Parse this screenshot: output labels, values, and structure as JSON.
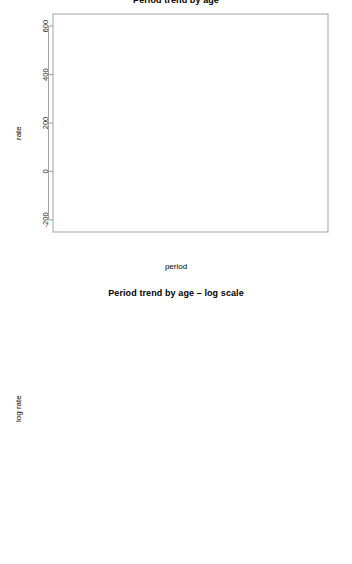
{
  "charts": [
    {
      "title": "Period trend by age",
      "xlabel": "period",
      "ylabel": "rate",
      "yticks": [
        "600",
        "400",
        "200",
        "0",
        "-200"
      ],
      "xticks": [
        "1980",
        "1985",
        "1990",
        "1995",
        "2000",
        "2005"
      ]
    },
    {
      "title": "Period trend by age – log scale",
      "xlabel": "",
      "ylabel": "log rate",
      "yticks": [
        "6",
        "4",
        "2",
        "0",
        "-2",
        "-4"
      ],
      "xticks": [
        "1980",
        "1985",
        "1990",
        "1995",
        "2000",
        "2005"
      ]
    }
  ],
  "legend": {
    "columns": [
      [
        "20",
        "25",
        "30"
      ],
      [
        "35",
        "40",
        "45"
      ],
      [
        "50",
        "55",
        "60"
      ],
      [
        "65",
        "70",
        "75"
      ],
      [
        "80",
        "85"
      ]
    ],
    "entries": [
      "20",
      "25",
      "30",
      "35",
      "40",
      "45",
      "50",
      "55",
      "60",
      "65",
      "70",
      "75",
      "80",
      "85"
    ]
  },
  "colors": {
    "line": "#5a5a5a",
    "frame": "#8c8c8c",
    "text": "#000000",
    "background": "#ffffff"
  },
  "chart_data": [
    {
      "type": "line",
      "title": "Period trend by age",
      "xlabel": "period",
      "ylabel": "rate",
      "x": [
        1980,
        1985,
        1990,
        1995,
        2000,
        2005
      ],
      "xlim": [
        1978,
        2007
      ],
      "ylim": [
        -250,
        650
      ],
      "grid": false,
      "legend_position": "bottom-inside",
      "series": [
        {
          "name": "20",
          "values": [
            0.6,
            0.5,
            0.5,
            0.4,
            0.4,
            0.3
          ]
        },
        {
          "name": "25",
          "values": [
            2.0,
            1.8,
            1.6,
            1.4,
            1.2,
            1.0
          ]
        },
        {
          "name": "30",
          "values": [
            6.0,
            5.5,
            5.0,
            4.2,
            3.6,
            3.0
          ]
        },
        {
          "name": "35",
          "values": [
            15,
            14,
            13,
            11,
            9,
            8
          ]
        },
        {
          "name": "40",
          "values": [
            50,
            44,
            38,
            30,
            24,
            20
          ]
        },
        {
          "name": "45",
          "values": [
            100,
            95,
            82,
            63,
            52,
            46
          ]
        },
        {
          "name": "50",
          "values": [
            178,
            178,
            158,
            131,
            106,
            86
          ]
        },
        {
          "name": "55",
          "values": [
            260,
            273,
            263,
            222,
            191,
            158
          ]
        },
        {
          "name": "60",
          "values": [
            370,
            375,
            385,
            345,
            298,
            253
          ]
        },
        {
          "name": "65",
          "values": [
            400,
            460,
            470,
            460,
            417,
            362
          ]
        },
        {
          "name": "70",
          "values": [
            460,
            478,
            521,
            528,
            513,
            460
          ]
        },
        {
          "name": "75",
          "values": [
            500,
            548,
            549,
            530,
            516,
            506
          ]
        },
        {
          "name": "80",
          "values": [
            498,
            560,
            593,
            570,
            543,
            530
          ]
        },
        {
          "name": "85",
          "values": [
            508,
            553,
            548,
            533,
            525,
            528
          ]
        }
      ]
    },
    {
      "type": "line",
      "title": "Period trend by age – log scale",
      "xlabel": "",
      "ylabel": "log rate",
      "x": [
        1980,
        1985,
        1990,
        1995,
        2000,
        2005
      ],
      "xlim": [
        1978,
        2007
      ],
      "ylim": [
        -4.8,
        7.0
      ],
      "grid": false,
      "legend_position": "bottom-inside",
      "series": [
        {
          "name": "20",
          "values": [
            -1.2,
            -1.2,
            -1.35,
            -1.4,
            -1.45,
            -1.5
          ]
        },
        {
          "name": "25",
          "values": [
            0.35,
            0.3,
            0.1,
            0.0,
            -0.05,
            -0.1
          ]
        },
        {
          "name": "30",
          "values": [
            1.45,
            1.4,
            1.3,
            1.0,
            0.95,
            0.9
          ]
        },
        {
          "name": "35",
          "values": [
            2.6,
            2.55,
            2.45,
            2.25,
            2.05,
            1.95
          ]
        },
        {
          "name": "40",
          "values": [
            3.9,
            3.75,
            3.6,
            3.4,
            3.2,
            3.0
          ]
        },
        {
          "name": "45",
          "values": [
            4.6,
            4.55,
            4.4,
            4.15,
            3.95,
            3.85
          ]
        },
        {
          "name": "50",
          "values": [
            5.15,
            5.15,
            5.05,
            4.85,
            4.65,
            4.45
          ]
        },
        {
          "name": "55",
          "values": [
            5.55,
            5.6,
            5.55,
            5.4,
            5.25,
            5.05
          ]
        },
        {
          "name": "60",
          "values": [
            5.9,
            5.9,
            5.95,
            5.85,
            5.7,
            5.55
          ]
        },
        {
          "name": "65",
          "values": [
            6.0,
            6.1,
            6.15,
            6.1,
            6.05,
            5.9
          ]
        },
        {
          "name": "70",
          "values": [
            6.15,
            6.2,
            6.25,
            6.25,
            6.25,
            6.15
          ]
        },
        {
          "name": "75",
          "values": [
            6.2,
            6.3,
            6.3,
            6.3,
            6.25,
            6.2
          ]
        },
        {
          "name": "80",
          "values": [
            6.2,
            6.35,
            6.4,
            6.35,
            6.3,
            6.25
          ]
        },
        {
          "name": "85",
          "values": [
            6.25,
            6.3,
            6.3,
            6.3,
            6.25,
            6.25
          ]
        }
      ]
    }
  ]
}
